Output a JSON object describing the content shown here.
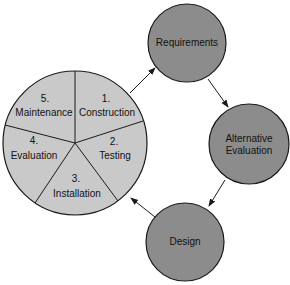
{
  "colors": {
    "pie_fill": "#c9c9c9",
    "node_fill": "#8c8c8c",
    "stroke": "#1a1a1a",
    "background": "#ffffff"
  },
  "pie": {
    "segments": [
      {
        "number": "1.",
        "label": "Construction"
      },
      {
        "number": "2.",
        "label": "Testing"
      },
      {
        "number": "3.",
        "label": "Installation"
      },
      {
        "number": "4.",
        "label": "Evaluation"
      },
      {
        "number": "5.",
        "label": "Maintenance"
      }
    ]
  },
  "nodes": [
    {
      "label": "Requirements"
    },
    {
      "label_line1": "Alternative",
      "label_line2": "Evaluation"
    },
    {
      "label": "Design"
    }
  ]
}
